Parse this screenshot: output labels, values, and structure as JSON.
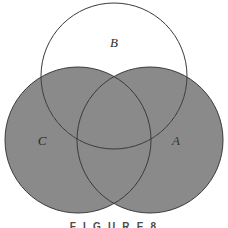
{
  "figure": {
    "caption": "F I G U R E   8",
    "caption_plain": "FIGURE 8",
    "background_color": "#ffffff"
  },
  "diagram": {
    "type": "venn-three-circle",
    "stroke_color": "#3a3a3a",
    "stroke_width": 1,
    "shade_color": "#8a8a8a",
    "unshaded_color": "#ffffff",
    "shaded_description": "A union C",
    "unshaded_description": "B only",
    "circles": [
      {
        "id": "A",
        "label": "A",
        "cx": 150,
        "cy": 140,
        "r": 73,
        "label_x": 176,
        "label_y": 142,
        "shaded": true
      },
      {
        "id": "B",
        "label": "B",
        "cx": 114,
        "cy": 76,
        "r": 73,
        "label_x": 114,
        "label_y": 44,
        "shaded": false
      },
      {
        "id": "C",
        "label": "C",
        "cx": 78,
        "cy": 140,
        "r": 73,
        "label_x": 42,
        "label_y": 142,
        "shaded": true
      }
    ]
  }
}
